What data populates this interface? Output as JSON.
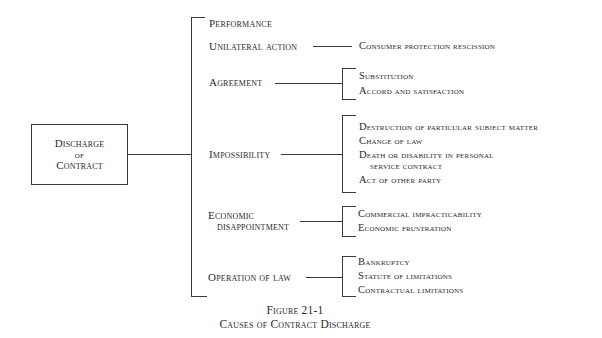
{
  "root": {
    "lines": [
      "Discharge",
      "of",
      "Contract"
    ]
  },
  "branches": [
    {
      "label": "Performance",
      "children": []
    },
    {
      "label": "Unilateral action",
      "children": [
        "Consumer protection rescission"
      ]
    },
    {
      "label": "Agreement",
      "children": [
        "Substitution",
        "Accord and satisfaction"
      ]
    },
    {
      "label": "Impossibility",
      "children": [
        "Destruction of particular subject matter",
        "Change of law",
        "Death or disability in personal",
        "service contract",
        "Act of other party"
      ]
    },
    {
      "label_line1": "Economic",
      "label_line2": "disappointment",
      "children": [
        "Commercial impracticability",
        "Economic frustration"
      ]
    },
    {
      "label": "Operation of law",
      "children": [
        "Bankruptcy",
        "Statute of limitations",
        "Contractual limitations"
      ]
    }
  ],
  "caption": {
    "figure": "Figure 21-1",
    "title": "Causes of Contract Discharge"
  }
}
